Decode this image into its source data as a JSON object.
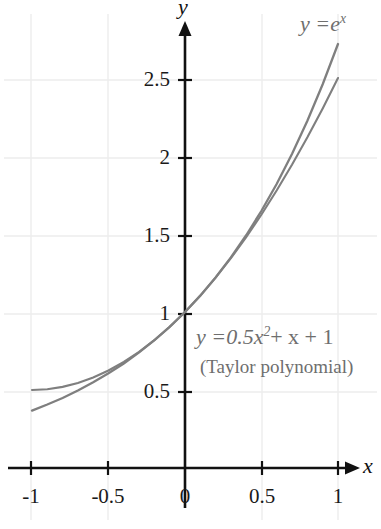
{
  "chart_data": {
    "type": "line",
    "title": "",
    "xlabel": "x",
    "ylabel": "y",
    "xlim": [
      -1.12,
      1.12
    ],
    "ylim": [
      -0.62,
      2.95
    ],
    "grid": true,
    "legend_position": "inline-annotations",
    "xticks": [
      "-1",
      "-0.5",
      "0",
      "0.5",
      "1"
    ],
    "xtick_values": [
      -1,
      -0.5,
      0,
      0.5,
      1
    ],
    "yticks": [
      "0.5",
      "1",
      "1.5",
      "2",
      "2.5"
    ],
    "ytick_values": [
      0.5,
      1,
      1.5,
      2,
      2.5
    ],
    "series": [
      {
        "name": "y = e^x",
        "x": [
          -1,
          -0.9,
          -0.8,
          -0.7,
          -0.6,
          -0.5,
          -0.4,
          -0.3,
          -0.2,
          -0.1,
          0,
          0.1,
          0.2,
          0.3,
          0.4,
          0.5,
          0.6,
          0.7,
          0.8,
          0.9,
          1
        ],
        "values": [
          0.368,
          0.407,
          0.449,
          0.497,
          0.549,
          0.607,
          0.67,
          0.741,
          0.819,
          0.905,
          1.0,
          1.105,
          1.221,
          1.35,
          1.492,
          1.649,
          1.822,
          2.014,
          2.226,
          2.46,
          2.718
        ]
      },
      {
        "name": "y = 0.5x^2 + x + 1",
        "x": [
          -1,
          -0.9,
          -0.8,
          -0.7,
          -0.6,
          -0.5,
          -0.4,
          -0.3,
          -0.2,
          -0.1,
          0,
          0.1,
          0.2,
          0.3,
          0.4,
          0.5,
          0.6,
          0.7,
          0.8,
          0.9,
          1
        ],
        "values": [
          0.5,
          0.505,
          0.52,
          0.545,
          0.58,
          0.625,
          0.68,
          0.745,
          0.82,
          0.905,
          1.0,
          1.105,
          1.22,
          1.345,
          1.48,
          1.625,
          1.78,
          1.945,
          2.12,
          2.305,
          2.5
        ]
      }
    ],
    "annotations": [
      {
        "text": "y = e",
        "sup": "x",
        "role": "exponential-curve-label"
      },
      {
        "text": "y = 0.5x",
        "sup": "2",
        "tail": " + x + 1",
        "role": "taylor-curve-label"
      },
      {
        "text": "(Taylor polynomial)",
        "role": "taylor-sublabel"
      }
    ],
    "colors": {
      "curve": "#7f7f7f",
      "axis": "#111111",
      "grid": "#ededed",
      "tick_text": "#1a1a1a",
      "annotation_text": "#6e6e6e",
      "background": "#ffffff"
    }
  },
  "labels": {
    "axis_x": "x",
    "axis_y": "y",
    "exp_lhs": "y =",
    "exp_base": "e",
    "exp_power": "x",
    "taylor_lhs": "y =",
    "taylor_coeff": "0.5x",
    "taylor_power": "2",
    "taylor_tail": "+ x + 1",
    "taylor_note": "(Taylor polynomial)",
    "xtick_neg1": "-1",
    "xtick_neg05": "-0.5",
    "xtick_0": "0",
    "xtick_05": "0.5",
    "xtick_1": "1",
    "ytick_05": "0.5",
    "ytick_1": "1",
    "ytick_15": "1.5",
    "ytick_2": "2",
    "ytick_25": "2.5"
  }
}
